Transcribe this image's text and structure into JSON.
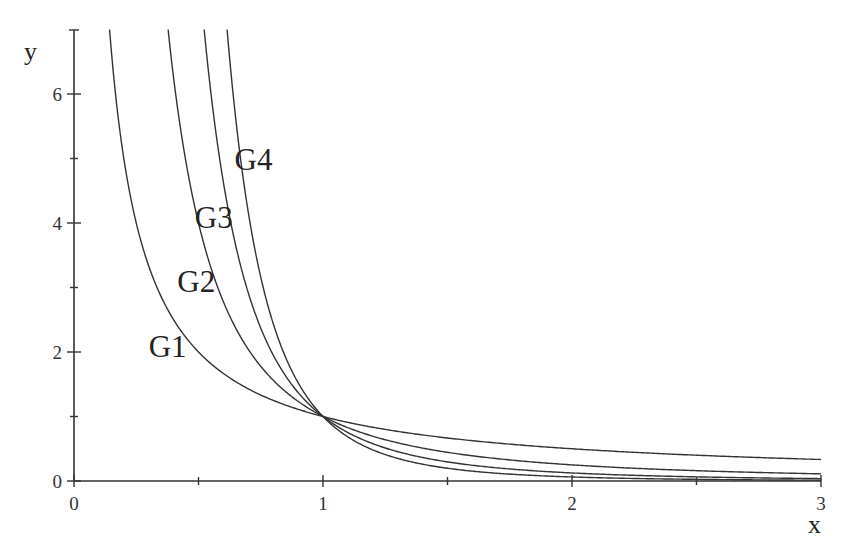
{
  "chart_data": {
    "type": "line",
    "title": "",
    "xlabel": "x",
    "ylabel": "y",
    "xlim": [
      0,
      3
    ],
    "ylim": [
      0,
      7
    ],
    "grid": false,
    "legend": "inline labels near curves",
    "x_ticks": [
      0,
      1,
      2,
      3
    ],
    "x_tick_labels": [
      "0",
      "1",
      "2",
      "3"
    ],
    "x_minor_ticks": [
      0.5,
      1.5,
      2.5
    ],
    "y_ticks": [
      0,
      2,
      4,
      6
    ],
    "y_tick_labels": [
      "0",
      "2",
      "4",
      "6"
    ],
    "y_minor_ticks": [
      1,
      3,
      5
    ],
    "annotations": [
      "All curves intersect at (1, 1)"
    ],
    "series": [
      {
        "name": "G1",
        "formula": "y = 1/x",
        "exponent": 1,
        "label_pos": [
          0.3,
          2.1
        ],
        "points": [
          [
            0.143,
            7
          ],
          [
            0.25,
            4
          ],
          [
            0.5,
            2
          ],
          [
            1,
            1
          ],
          [
            1.5,
            0.667
          ],
          [
            2,
            0.5
          ],
          [
            2.5,
            0.4
          ],
          [
            3,
            0.333
          ]
        ]
      },
      {
        "name": "G2",
        "formula": "y = 1/x^2",
        "exponent": 2,
        "label_pos": [
          0.415,
          3.1
        ],
        "points": [
          [
            0.378,
            7
          ],
          [
            0.5,
            4
          ],
          [
            0.75,
            1.778
          ],
          [
            1,
            1
          ],
          [
            1.5,
            0.444
          ],
          [
            2,
            0.25
          ],
          [
            2.5,
            0.16
          ],
          [
            3,
            0.111
          ]
        ]
      },
      {
        "name": "G3",
        "formula": "y = 1/x^3",
        "exponent": 3,
        "label_pos": [
          0.485,
          4.1
        ],
        "points": [
          [
            0.523,
            7
          ],
          [
            0.63,
            4
          ],
          [
            0.8,
            1.953
          ],
          [
            1,
            1
          ],
          [
            1.5,
            0.296
          ],
          [
            2,
            0.125
          ],
          [
            2.5,
            0.064
          ],
          [
            3,
            0.037
          ]
        ]
      },
      {
        "name": "G4",
        "formula": "y = 1/x^4",
        "exponent": 4,
        "label_pos": [
          0.645,
          5.0
        ],
        "points": [
          [
            0.614,
            7
          ],
          [
            0.707,
            4
          ],
          [
            0.85,
            1.916
          ],
          [
            1,
            1
          ],
          [
            1.5,
            0.198
          ],
          [
            2,
            0.0625
          ],
          [
            2.5,
            0.0256
          ],
          [
            3,
            0.0123
          ]
        ]
      }
    ]
  },
  "axes": {
    "x_label": "x",
    "y_label": "y"
  },
  "colors": {
    "line": "#333333",
    "background": "#ffffff"
  }
}
